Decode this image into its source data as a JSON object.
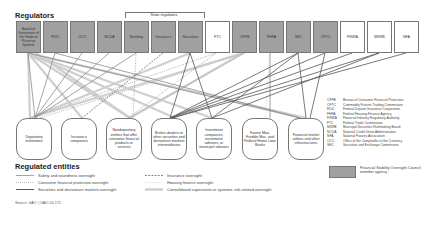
{
  "regulators_title": "Regulators",
  "state_regulators_label": "State regulators",
  "regulators": [
    {
      "id": "frs",
      "label": "Board of Governors of the Federal Reserve System",
      "fsoc": true
    },
    {
      "id": "fdic",
      "label": "FDIC",
      "fsoc": true
    },
    {
      "id": "occ",
      "label": "OCC",
      "fsoc": true
    },
    {
      "id": "ncua",
      "label": "NCUA",
      "fsoc": true
    },
    {
      "id": "banking",
      "label": "Banking",
      "fsoc": true
    },
    {
      "id": "insurance",
      "label": "Insurance",
      "fsoc": true
    },
    {
      "id": "securities",
      "label": "Securities",
      "fsoc": true
    },
    {
      "id": "ftc",
      "label": "FTC",
      "fsoc": false
    },
    {
      "id": "cfpb",
      "label": "CFPB",
      "fsoc": true
    },
    {
      "id": "fhfa",
      "label": "FHFA",
      "fsoc": true
    },
    {
      "id": "sec",
      "label": "SEC",
      "fsoc": true
    },
    {
      "id": "cftc",
      "label": "CFTC",
      "fsoc": true
    },
    {
      "id": "finra",
      "label": "FINRA",
      "fsoc": false
    },
    {
      "id": "msrb",
      "label": "MSRB",
      "fsoc": false
    },
    {
      "id": "nfa",
      "label": "NFA",
      "fsoc": false
    }
  ],
  "entities_title": "Regulated entities",
  "entities": [
    {
      "id": "depository",
      "label": "Depository institutions"
    },
    {
      "id": "insurance_cos",
      "label": "Insurance companies"
    },
    {
      "id": "nondepository",
      "label": "Nondepository entities that offer consumer financial products or services"
    },
    {
      "id": "broker",
      "label": "Broker-dealers or other securities and derivatives markets intermediaries"
    },
    {
      "id": "investment",
      "label": "Investment companies, investment advisers, or municipal advisors"
    },
    {
      "id": "gse",
      "label": "Fannie Mae, Freddie Mac, and Federal Home Loan Banks"
    },
    {
      "id": "fmu",
      "label": "Financial market utilities and other infrastructures"
    }
  ],
  "abbreviations": [
    {
      "k": "CFPB",
      "v": "Bureau of Consumer Financial Protection"
    },
    {
      "k": "CFTC",
      "v": "Commodity Futures Trading Commission"
    },
    {
      "k": "FDIC",
      "v": "Federal Deposit Insurance Corporation"
    },
    {
      "k": "FHFA",
      "v": "Federal Housing Finance Agency"
    },
    {
      "k": "FINRA",
      "v": "Financial Industry Regulatory Authority"
    },
    {
      "k": "FTC",
      "v": "Federal Trade Commission"
    },
    {
      "k": "MSRB",
      "v": "Municipal Securities Rulemaking Board"
    },
    {
      "k": "NCUA",
      "v": "National Credit Union Administration"
    },
    {
      "k": "NFA",
      "v": "National Futures Association"
    },
    {
      "k": "OCC",
      "v": "Office of the Comptroller of the Currency"
    },
    {
      "k": "SEC",
      "v": "Securities and Exchange Commission"
    }
  ],
  "legend": {
    "safety": "Safety and soundness oversight",
    "consumer": "Consumer financial protection oversight",
    "securities": "Securities and derivatives markets oversight",
    "insurance": "Insurance oversight",
    "housing": "Housing finance oversight",
    "consolidated": "Consolidated supervision or systemic risk-related oversight",
    "fsoc": "Financial Stability Oversight Council member agency"
  },
  "colors": {
    "fsoc_fill": "#a0a0a0",
    "safety_line": "#8a8a8a",
    "consumer_line": "#b0b0b0",
    "securities_line": "#555555",
    "consolidated_line": "#c8c8c8"
  },
  "source": "Source: GAO.  |  GAO-16-175"
}
